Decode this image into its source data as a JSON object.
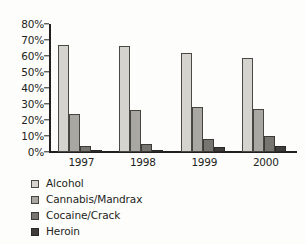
{
  "chart_data": {
    "type": "bar",
    "title": "",
    "subtitle": "",
    "xlabel": "",
    "ylabel": "",
    "categories": [
      "1997",
      "1998",
      "1999",
      "2000"
    ],
    "series": [
      {
        "name": "Alcohol",
        "color": "#d5d3ce",
        "values": [
          67,
          66,
          62,
          59
        ]
      },
      {
        "name": "Cannabis/Mandrax",
        "color": "#a9a7a2",
        "values": [
          24,
          26,
          28,
          27
        ]
      },
      {
        "name": "Cocaine/Crack",
        "color": "#77756f",
        "values": [
          4,
          5,
          8,
          10
        ]
      },
      {
        "name": "Heroin",
        "color": "#3e3c3a",
        "values": [
          1,
          1.5,
          3,
          4
        ]
      }
    ],
    "ylim": [
      0,
      80
    ],
    "ytick_step": 10,
    "ytick_labels": [
      "0%",
      "10%",
      "20%",
      "30%",
      "40%",
      "50%",
      "60%",
      "70%",
      "80%"
    ],
    "ytick_values": [
      0,
      10,
      20,
      30,
      40,
      50,
      60,
      70,
      80
    ],
    "grid": false,
    "legend_position": "bottom-left",
    "value_suffix": "%",
    "axis_color": "#231f20",
    "background": "#fdfdfc"
  },
  "legend": {
    "items": [
      {
        "label": "Alcohol"
      },
      {
        "label": "Cannabis/Mandrax"
      },
      {
        "label": "Cocaine/Crack"
      },
      {
        "label": "Heroin"
      }
    ]
  }
}
